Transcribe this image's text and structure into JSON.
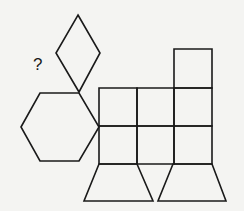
{
  "figure": {
    "question_mark": "?",
    "stroke_color": "#1a1a1a",
    "background_color": "#f4f4f2",
    "shapes": {
      "rhombus": "78,15 100,53 79,92 56,53",
      "hexagon": "21,127 40,93 79,93 99,127 79,161 40,161",
      "grid_square_r1c1": "99,88 137,88 137,126 99,126",
      "grid_square_r1c2": "137,88 174,88 174,126 137,126",
      "grid_square_r1c3": "174,88 212,88 212,126 174,126",
      "grid_square_r2c1": "99,126 137,126 137,164 99,164",
      "grid_square_r2c2": "137,126 174,126 174,164 137,164",
      "grid_square_r2c3": "174,126 212,126 212,164 174,164",
      "tower_square": "174,49 212,49 212,88 174,88",
      "left_trapezoid": "99,164 137,164 153,201 84,201",
      "right_trapezoid": "173,164 212,164 226,201 158,201"
    }
  }
}
